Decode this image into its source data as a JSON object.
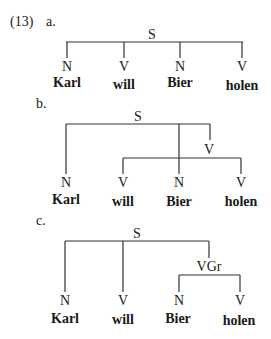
{
  "example_number": "(13)",
  "trees": [
    {
      "label": "a.",
      "root": "S",
      "leaves": [
        {
          "cat": "N",
          "word": "Karl"
        },
        {
          "cat": "V",
          "word": "will"
        },
        {
          "cat": "N",
          "word": "Bier"
        },
        {
          "cat": "V",
          "word": "holen"
        }
      ]
    },
    {
      "label": "b.",
      "root": "S",
      "inner": "V",
      "leaves": [
        {
          "cat": "N",
          "word": "Karl"
        },
        {
          "cat": "V",
          "word": "will"
        },
        {
          "cat": "N",
          "word": "Bier"
        },
        {
          "cat": "V",
          "word": "holen"
        }
      ]
    },
    {
      "label": "c.",
      "root": "S",
      "inner": "VGr",
      "leaves": [
        {
          "cat": "N",
          "word": "Karl"
        },
        {
          "cat": "V",
          "word": "will"
        },
        {
          "cat": "N",
          "word": "Bier"
        },
        {
          "cat": "V",
          "word": "holen"
        }
      ]
    }
  ]
}
